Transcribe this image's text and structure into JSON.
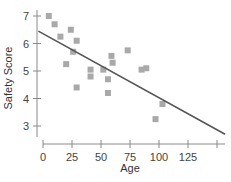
{
  "chart_data": {
    "type": "scatter",
    "title": "",
    "xlabel": "Age",
    "ylabel": "Safety Score",
    "xlim": [
      -5,
      157
    ],
    "ylim": [
      2.5,
      7.2
    ],
    "x_ticks": [
      0,
      25,
      50,
      75,
      100,
      125,
      150
    ],
    "x_tick_labels": [
      "0",
      "25",
      "50",
      "75",
      "100",
      "125",
      ""
    ],
    "y_ticks": [
      3,
      4,
      5,
      6,
      7
    ],
    "y_tick_labels": [
      "3",
      "4",
      "5",
      "6",
      "7"
    ],
    "grid": false,
    "legend": null,
    "series": [
      {
        "name": "observations",
        "marker": "square",
        "color": "#a9a9a9",
        "points": [
          {
            "x": 5,
            "y": 7.0
          },
          {
            "x": 10,
            "y": 6.7
          },
          {
            "x": 15,
            "y": 6.25
          },
          {
            "x": 20,
            "y": 5.25
          },
          {
            "x": 24,
            "y": 6.5
          },
          {
            "x": 26,
            "y": 5.7
          },
          {
            "x": 29,
            "y": 6.1
          },
          {
            "x": 29,
            "y": 4.4
          },
          {
            "x": 41,
            "y": 5.05
          },
          {
            "x": 41,
            "y": 4.8
          },
          {
            "x": 52,
            "y": 5.05
          },
          {
            "x": 56,
            "y": 4.7
          },
          {
            "x": 56,
            "y": 4.2
          },
          {
            "x": 59,
            "y": 5.55
          },
          {
            "x": 60,
            "y": 5.3
          },
          {
            "x": 73,
            "y": 5.75
          },
          {
            "x": 85,
            "y": 5.05
          },
          {
            "x": 89,
            "y": 5.1
          },
          {
            "x": 97,
            "y": 3.25
          },
          {
            "x": 103,
            "y": 3.8
          }
        ]
      }
    ],
    "regression_line": {
      "color": "#555555",
      "start": {
        "x": -4,
        "y": 6.45
      },
      "end": {
        "x": 157,
        "y": 2.7
      }
    }
  }
}
